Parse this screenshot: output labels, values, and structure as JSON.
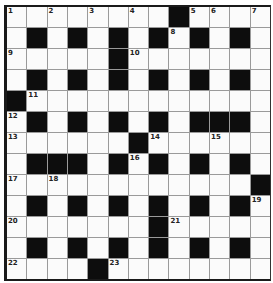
{
  "puzzle": {
    "rows": 13,
    "cols": 13,
    "colors": {
      "black": "#0d0d0d",
      "white": "#fbfbfb",
      "gridline": "#9a9a9a"
    },
    "layout": [
      "1.2.3.4#567",
      "x"
    ],
    "grid": [
      [
        "1",
        "",
        "2",
        "",
        "3",
        "",
        "4",
        "",
        "#",
        "5",
        "6",
        "",
        "7"
      ],
      [
        "",
        "#",
        "",
        "#",
        "",
        "#",
        "",
        "#",
        "8",
        "#",
        "",
        "#",
        ""
      ],
      [
        "9",
        "",
        "",
        "",
        "",
        "#",
        "10",
        "",
        "",
        "",
        "",
        "",
        ""
      ],
      [
        "",
        "#",
        "",
        "#",
        "",
        "#",
        "",
        "#",
        "",
        "#",
        "",
        "#",
        ""
      ],
      [
        "#",
        "11",
        "",
        "",
        "",
        "",
        "",
        "",
        "",
        "",
        "",
        "",
        ""
      ],
      [
        "12",
        "#",
        "",
        "#",
        "",
        "#",
        "",
        "#",
        "",
        "#",
        "#",
        "#",
        ""
      ],
      [
        "13",
        "",
        "",
        "",
        "",
        "",
        "#",
        "14",
        "",
        "",
        "15",
        "",
        ""
      ],
      [
        "",
        "#",
        "#",
        "#",
        "",
        "#",
        "16",
        "#",
        "",
        "#",
        "",
        "#",
        ""
      ],
      [
        "17",
        "",
        "18",
        "",
        "",
        "",
        "",
        "",
        "",
        "",
        "",
        "",
        "#"
      ],
      [
        "",
        "#",
        "",
        "#",
        "",
        "#",
        "",
        "#",
        "",
        "#",
        "",
        "#",
        "19"
      ],
      [
        "20",
        "",
        "",
        "",
        "",
        "",
        "",
        "#",
        "21",
        "",
        "",
        "",
        ""
      ],
      [
        "",
        "#",
        "",
        "#",
        "",
        "#",
        "",
        "#",
        "",
        "#",
        "",
        "#",
        ""
      ],
      [
        "22",
        "",
        "",
        "",
        "#",
        "23",
        "",
        "",
        "",
        "",
        "",
        "",
        ""
      ]
    ]
  }
}
